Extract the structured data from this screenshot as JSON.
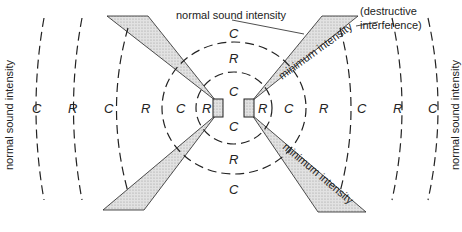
{
  "colors": {
    "line": "#222222",
    "shade": "#d4d4d4",
    "background": "#ffffff"
  },
  "annotations": {
    "top": "normal sound intensity",
    "left": "normal sound intensity",
    "right": "normal sound intensity",
    "destructive_line1": "(destructive",
    "destructive_line2": "interference)",
    "min_upper": "minimum intensity",
    "min_lower": "minimum intensity"
  },
  "region_letters": {
    "left_row": [
      "C",
      "R",
      "C",
      "R",
      "C",
      "R"
    ],
    "right_row": [
      "R",
      "C",
      "R",
      "C",
      "R",
      "C"
    ],
    "center_column_top": [
      "C",
      "R",
      "C"
    ],
    "center_column_bottom": [
      "C",
      "R",
      "C"
    ]
  },
  "legend_meaning": {
    "C": "compression",
    "R": "rarefaction"
  },
  "speakers": [
    "left-speaker",
    "right-speaker"
  ]
}
